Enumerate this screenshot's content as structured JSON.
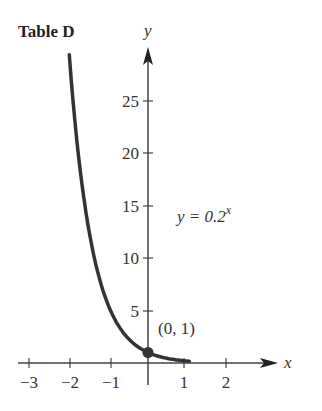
{
  "title": "Table D",
  "equation": {
    "lhs": "y = 0.2",
    "exponent": "x"
  },
  "point_label": "(0, 1)",
  "axes": {
    "x_name": "x",
    "y_name": "y"
  },
  "chart_data": {
    "type": "line",
    "title": "Table D",
    "xlabel": "x",
    "ylabel": "y",
    "function": "y = 0.2^x",
    "x_ticks": [
      -3,
      -2,
      -1,
      1,
      2
    ],
    "y_ticks": [
      5,
      10,
      15,
      20,
      25
    ],
    "xlim": [
      -3.2,
      3.2
    ],
    "ylim": [
      0,
      30
    ],
    "series": [
      {
        "name": "y = 0.2^x",
        "x": [
          -2.1,
          -2,
          -1.5,
          -1,
          -0.5,
          0,
          0.5,
          1,
          1.1
        ],
        "y": [
          29.4,
          25,
          11.2,
          5,
          2.24,
          1,
          0.45,
          0.2,
          0.17
        ]
      }
    ],
    "annotations": [
      {
        "text": "(0, 1)",
        "x": 0,
        "y": 1
      },
      {
        "text": "y = 0.2^x",
        "x": 1.2,
        "y": 14.5
      }
    ],
    "grid": false
  }
}
